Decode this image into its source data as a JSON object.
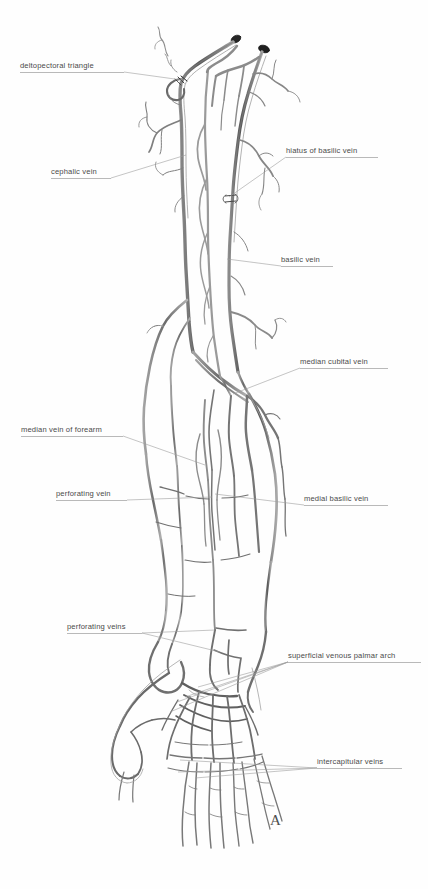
{
  "figure": {
    "panel_letter": "A",
    "background_color": "#fefefe",
    "ink_color": "#5c5c5c",
    "leader_color": "#a8a8a8",
    "text_color": "#4a4a4a",
    "width": 428,
    "height": 889
  },
  "labels": [
    {
      "id": "deltopectoral-triangle",
      "text": "deltopectoral triangle",
      "side": "left",
      "x": 20,
      "y": 61,
      "width": 104,
      "leader": [
        [
          124,
          72
        ],
        [
          182,
          80
        ]
      ]
    },
    {
      "id": "cephalic-vein",
      "text": "cephalic vein",
      "side": "left",
      "x": 51,
      "y": 167,
      "width": 60,
      "leader": [
        [
          111,
          178
        ],
        [
          186,
          155
        ]
      ]
    },
    {
      "id": "hiatus-of-basilic-vein",
      "text": "hiatus of basilic vein",
      "side": "right",
      "x": 286,
      "y": 146,
      "width": 92,
      "leader": [
        [
          286,
          157
        ],
        [
          229,
          197
        ]
      ]
    },
    {
      "id": "basilic-vein",
      "text": "basilic vein",
      "side": "right",
      "x": 281,
      "y": 255,
      "width": 52,
      "leader": [
        [
          281,
          266
        ],
        [
          227,
          259
        ]
      ]
    },
    {
      "id": "median-cubital-vein",
      "text": "median cubital vein",
      "side": "right",
      "x": 300,
      "y": 357,
      "width": 88,
      "leader": [
        [
          300,
          368
        ],
        [
          233,
          394
        ]
      ]
    },
    {
      "id": "median-vein-of-forearm",
      "text": "median vein of forearm",
      "side": "left",
      "x": 21,
      "y": 425,
      "width": 102,
      "leader": [
        [
          123,
          436
        ],
        [
          205,
          465
        ]
      ]
    },
    {
      "id": "perforating-vein",
      "text": "perforating vein",
      "side": "left",
      "x": 56,
      "y": 489,
      "width": 71,
      "leader": [
        [
          127,
          500
        ],
        [
          212,
          497
        ]
      ]
    },
    {
      "id": "medial-basilic-vein",
      "text": "medial basilic vein",
      "side": "right",
      "x": 304,
      "y": 494,
      "width": 84,
      "leader": [
        [
          304,
          505
        ],
        [
          215,
          494
        ]
      ]
    },
    {
      "id": "perforating-veins",
      "text": "perforating veins",
      "side": "left",
      "x": 67,
      "y": 622,
      "width": 75,
      "leader": [
        [
          142,
          633
        ],
        [
          215,
          630
        ]
      ],
      "leader2": [
        [
          142,
          633
        ],
        [
          220,
          652
        ]
      ]
    },
    {
      "id": "superficial-venous-palmar-arch",
      "text": "superficial venous palmar arch",
      "side": "right",
      "x": 288,
      "y": 651,
      "width": 133,
      "leader": [
        [
          288,
          662
        ],
        [
          198,
          687
        ]
      ],
      "leader2": [
        [
          288,
          662
        ],
        [
          177,
          702
        ]
      ],
      "leader3": [
        [
          288,
          662
        ],
        [
          170,
          712
        ]
      ],
      "leader4": [
        [
          288,
          662
        ],
        [
          185,
          697
        ]
      ]
    },
    {
      "id": "intercapitular-veins",
      "text": "intercapitular veins",
      "side": "right",
      "x": 317,
      "y": 757,
      "width": 85,
      "leader": [
        [
          317,
          768
        ],
        [
          180,
          760
        ]
      ],
      "leader2": [
        [
          317,
          768
        ],
        [
          178,
          772
        ]
      ],
      "leader3": [
        [
          317,
          768
        ],
        [
          195,
          778
        ]
      ]
    }
  ],
  "anatomy": {
    "structures": [
      "cephalic vein",
      "basilic vein",
      "median cubital vein",
      "median vein of forearm",
      "medial basilic vein",
      "perforating veins",
      "superficial venous palmar arch",
      "intercapitular veins",
      "dorsal digital veins"
    ]
  }
}
